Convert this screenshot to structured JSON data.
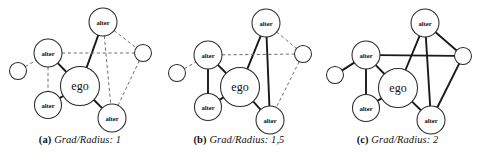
{
  "figure": {
    "node_labels": {
      "ego": "ego",
      "alter": "alter",
      "unlabeled": ""
    },
    "style": {
      "solid_edge_color": "#1a1a1a",
      "dashed_edge_color": "#6f6f6f",
      "node_fill": "#ffffff",
      "node_stroke": "#2a2a2a",
      "background": "#ffffff"
    }
  },
  "panels": [
    {
      "id": "a",
      "caption_letter": "(a)",
      "caption_text": "Grad/Radius: 1",
      "caption_full": "(a) Grad/Radius: 1",
      "nodes": [
        {
          "id": "top",
          "label": "alter",
          "x": 103,
          "y": 22,
          "r": 14,
          "kind": "alter"
        },
        {
          "id": "left",
          "label": "alter",
          "x": 48,
          "y": 53,
          "r": 14,
          "kind": "alter"
        },
        {
          "id": "smallL",
          "label": "",
          "x": 18,
          "y": 71,
          "r": 8.5,
          "kind": "plain"
        },
        {
          "id": "smallR",
          "label": "",
          "x": 143,
          "y": 53,
          "r": 8.5,
          "kind": "plain"
        },
        {
          "id": "ego",
          "label": "ego",
          "x": 80,
          "y": 86,
          "r": 19.5,
          "kind": "ego"
        },
        {
          "id": "bottomL",
          "label": "alter",
          "x": 48,
          "y": 105,
          "r": 13.5,
          "kind": "alter"
        },
        {
          "id": "bottomR",
          "label": "alter",
          "x": 112,
          "y": 118,
          "r": 14,
          "kind": "alter"
        }
      ],
      "edges": [
        {
          "from": "top",
          "to": "ego",
          "style": "solid"
        },
        {
          "from": "left",
          "to": "ego",
          "style": "solid"
        },
        {
          "from": "ego",
          "to": "bottomL",
          "style": "solid"
        },
        {
          "from": "ego",
          "to": "bottomR",
          "style": "solid"
        },
        {
          "from": "smallL",
          "to": "left",
          "style": "dashed"
        },
        {
          "from": "left",
          "to": "smallR",
          "style": "dashed"
        },
        {
          "from": "left",
          "to": "bottomL",
          "style": "dashed"
        },
        {
          "from": "top",
          "to": "smallR",
          "style": "dashed"
        },
        {
          "from": "top",
          "to": "bottomR",
          "style": "dashed"
        },
        {
          "from": "smallR",
          "to": "bottomR",
          "style": "dashed"
        }
      ]
    },
    {
      "id": "b",
      "caption_letter": "(b)",
      "caption_text": "Grad/Radius: 1,5",
      "caption_full": "(b) Grad/Radius: 1,5",
      "nodes": [
        {
          "id": "top",
          "label": "alter",
          "x": 108,
          "y": 23,
          "r": 14,
          "kind": "alter"
        },
        {
          "id": "left",
          "label": "alter",
          "x": 50,
          "y": 55,
          "r": 14,
          "kind": "alter"
        },
        {
          "id": "smallL",
          "label": "",
          "x": 19,
          "y": 73,
          "r": 8.5,
          "kind": "plain"
        },
        {
          "id": "smallR",
          "label": "",
          "x": 145,
          "y": 54,
          "r": 8.5,
          "kind": "plain"
        },
        {
          "id": "ego",
          "label": "ego",
          "x": 82,
          "y": 87,
          "r": 19.5,
          "kind": "ego"
        },
        {
          "id": "bottomL",
          "label": "alter",
          "x": 50,
          "y": 107,
          "r": 13.5,
          "kind": "alter"
        },
        {
          "id": "bottomR",
          "label": "alter",
          "x": 112,
          "y": 120,
          "r": 14,
          "kind": "alter"
        }
      ],
      "edges": [
        {
          "from": "top",
          "to": "ego",
          "style": "solid"
        },
        {
          "from": "left",
          "to": "ego",
          "style": "solid"
        },
        {
          "from": "ego",
          "to": "bottomL",
          "style": "solid"
        },
        {
          "from": "ego",
          "to": "bottomR",
          "style": "solid"
        },
        {
          "from": "left",
          "to": "bottomL",
          "style": "solid"
        },
        {
          "from": "top",
          "to": "bottomR",
          "style": "solid"
        },
        {
          "from": "smallL",
          "to": "left",
          "style": "dashed"
        },
        {
          "from": "left",
          "to": "smallR",
          "style": "dashed"
        },
        {
          "from": "top",
          "to": "smallR",
          "style": "dashed"
        },
        {
          "from": "smallR",
          "to": "bottomR",
          "style": "dashed"
        }
      ]
    },
    {
      "id": "c",
      "caption_letter": "(c)",
      "caption_text": "Grad/Radius: 2",
      "caption_full": "(c) Grad/Radius: 2",
      "nodes": [
        {
          "id": "top",
          "label": "alter",
          "x": 107,
          "y": 23,
          "r": 14,
          "kind": "alter"
        },
        {
          "id": "left",
          "label": "alter",
          "x": 48,
          "y": 55,
          "r": 14,
          "kind": "alter"
        },
        {
          "id": "smallL",
          "label": "",
          "x": 17,
          "y": 75,
          "r": 8.5,
          "kind": "plain"
        },
        {
          "id": "smallR",
          "label": "",
          "x": 145,
          "y": 56,
          "r": 8.5,
          "kind": "plain"
        },
        {
          "id": "ego",
          "label": "ego",
          "x": 80,
          "y": 88,
          "r": 19.5,
          "kind": "ego"
        },
        {
          "id": "bottomL",
          "label": "alter",
          "x": 48,
          "y": 108,
          "r": 13.5,
          "kind": "alter"
        },
        {
          "id": "bottomR",
          "label": "alter",
          "x": 113,
          "y": 120,
          "r": 14,
          "kind": "alter"
        }
      ],
      "edges": [
        {
          "from": "top",
          "to": "ego",
          "style": "solid"
        },
        {
          "from": "left",
          "to": "ego",
          "style": "solid"
        },
        {
          "from": "ego",
          "to": "bottomL",
          "style": "solid"
        },
        {
          "from": "ego",
          "to": "bottomR",
          "style": "solid"
        },
        {
          "from": "left",
          "to": "bottomL",
          "style": "solid"
        },
        {
          "from": "top",
          "to": "bottomR",
          "style": "solid"
        },
        {
          "from": "smallL",
          "to": "left",
          "style": "solid"
        },
        {
          "from": "left",
          "to": "smallR",
          "style": "solid"
        },
        {
          "from": "top",
          "to": "smallR",
          "style": "solid"
        },
        {
          "from": "smallR",
          "to": "bottomR",
          "style": "solid"
        }
      ]
    }
  ]
}
